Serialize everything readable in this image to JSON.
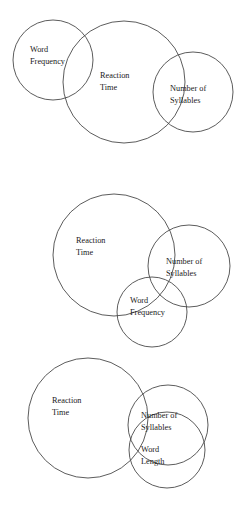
{
  "figure": {
    "background_color": "#ffffff",
    "stroke_color": "#4a4a4a",
    "text_color": "#1a1a1a",
    "width": 246,
    "height": 511
  },
  "diagrams": [
    {
      "id": "diagram-1",
      "circles": [
        {
          "name": "word-frequency",
          "label_line1": "Word",
          "label_line2": "Frequency",
          "cx": 53,
          "cy": 60,
          "r": 40,
          "label_x": 30,
          "label_y": 52
        },
        {
          "name": "reaction-time",
          "label_line1": "Reaction",
          "label_line2": "Time",
          "cx": 124,
          "cy": 82,
          "r": 61,
          "label_x": 100,
          "label_y": 78
        },
        {
          "name": "number-of-syllables",
          "label_line1": "Number of",
          "label_line2": "Syllables",
          "cx": 193,
          "cy": 92,
          "r": 40,
          "label_x": 170,
          "label_y": 91
        }
      ]
    },
    {
      "id": "diagram-2",
      "circles": [
        {
          "name": "reaction-time",
          "label_line1": "Reaction",
          "label_line2": "Time",
          "cx": 114,
          "cy": 255,
          "r": 61,
          "label_x": 76,
          "label_y": 243
        },
        {
          "name": "number-of-syllables",
          "label_line1": "Number of",
          "label_line2": "Syllables",
          "cx": 189,
          "cy": 266,
          "r": 41,
          "label_x": 166,
          "label_y": 264
        },
        {
          "name": "word-frequency",
          "label_line1": "Word",
          "label_line2": "Frequency",
          "cx": 152,
          "cy": 312,
          "r": 35,
          "label_x": 130,
          "label_y": 303
        }
      ]
    },
    {
      "id": "diagram-3",
      "circles": [
        {
          "name": "reaction-time",
          "label_line1": "Reaction",
          "label_line2": "Time",
          "cx": 88,
          "cy": 418,
          "r": 60,
          "label_x": 52,
          "label_y": 403
        },
        {
          "name": "number-of-syllables",
          "label_line1": "Number of",
          "label_line2": "Syllables",
          "cx": 168,
          "cy": 425,
          "r": 40,
          "label_x": 141,
          "label_y": 418
        },
        {
          "name": "word-length",
          "label_line1": "Word",
          "label_line2": "Length",
          "cx": 167,
          "cy": 450,
          "r": 38,
          "label_x": 141,
          "label_y": 452
        }
      ]
    }
  ]
}
